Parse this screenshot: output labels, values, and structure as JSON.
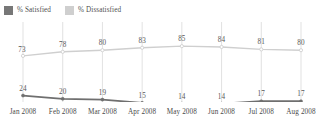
{
  "legend": {
    "position": "top-left",
    "entries": [
      {
        "label": "% Satisfied",
        "color": "#777777",
        "swatch_name": "legend-swatch-satisfied"
      },
      {
        "label": "% Dissatisfied",
        "color": "#cfcfcf",
        "swatch_name": "legend-swatch-dissatisfied"
      }
    ]
  },
  "chart_data": {
    "type": "line",
    "title": "",
    "subtitle": "",
    "xlabel": "",
    "ylabel": "",
    "grid": "vertical",
    "legend_position": "top-left",
    "ylim": [
      0,
      100
    ],
    "categories": [
      "Jan 2008",
      "Feb 2008",
      "Mar 2008",
      "Apr 2008",
      "May 2008",
      "Jun 2008",
      "Jul 2008",
      "Aug 2008"
    ],
    "series": [
      {
        "name": "% Dissatisfied",
        "color": "#cfcfcf",
        "marker": "circle-open",
        "values": [
          73,
          78,
          80,
          83,
          85,
          84,
          81,
          80
        ],
        "labels": [
          "73",
          "78",
          "80",
          "83",
          "85",
          "84",
          "81",
          "80"
        ]
      },
      {
        "name": "% Satisfied",
        "color": "#6f6f6f",
        "marker": "circle-filled",
        "values": [
          24,
          20,
          19,
          15,
          14,
          14,
          17,
          17
        ],
        "labels": [
          "24",
          "20",
          "19",
          "15",
          "14",
          "14",
          "17",
          "17"
        ]
      }
    ]
  },
  "colors": {
    "satisfied": "#6f6f6f",
    "dissatisfied": "#cfcfcf",
    "gridline": "#d9d9d9",
    "text": "#545454",
    "background": "#ffffff"
  }
}
